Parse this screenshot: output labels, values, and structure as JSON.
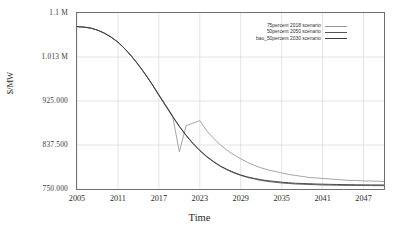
{
  "chart_data": {
    "type": "line",
    "title": "",
    "xlabel": "Time",
    "ylabel": "$/MW",
    "xlim": [
      2005,
      2050
    ],
    "ylim": [
      750000,
      1100000
    ],
    "grid": true,
    "legend_position": "top-right",
    "xticks": [
      "2005",
      "2011",
      "2017",
      "2023",
      "2029",
      "2035",
      "2041",
      "2047"
    ],
    "xtick_values": [
      2005,
      2011,
      2017,
      2023,
      2029,
      2035,
      2041,
      2047
    ],
    "yticks": [
      "750.000",
      "837.500",
      "925.000",
      "1.013 M",
      "1.1 M"
    ],
    "ytick_values": [
      750000,
      837500,
      925000,
      1012500,
      1100000
    ],
    "x": [
      2005,
      2006,
      2007,
      2008,
      2009,
      2010,
      2011,
      2012,
      2013,
      2014,
      2015,
      2016,
      2017,
      2018,
      2019,
      2020,
      2021,
      2022,
      2023,
      2024,
      2025,
      2026,
      2027,
      2028,
      2029,
      2030,
      2031,
      2032,
      2033,
      2034,
      2035,
      2036,
      2037,
      2038,
      2039,
      2040,
      2041,
      2042,
      2043,
      2044,
      2045,
      2046,
      2047,
      2048,
      2049,
      2050
    ],
    "series": [
      {
        "name": "75percent 2018 scenario",
        "color": "#9a9a9a",
        "values": [
          1073000,
          1072000,
          1070000,
          1066000,
          1060000,
          1052000,
          1042000,
          1029000,
          1014000,
          997000,
          979000,
          959000,
          938000,
          917000,
          896000,
          824000,
          876000,
          881000,
          886000,
          866000,
          851000,
          838000,
          827000,
          818000,
          810000,
          803000,
          797000,
          792000,
          788000,
          785000,
          782000,
          779000,
          777000,
          775000,
          773000,
          772000,
          771000,
          770000,
          769000,
          768000,
          767000,
          767000,
          766000,
          766000,
          765500,
          765000
        ]
      },
      {
        "name": "50percent 2050 scenario",
        "color": "#555555",
        "values": [
          1073000,
          1072000,
          1070000,
          1066000,
          1060000,
          1052000,
          1042000,
          1029000,
          1014000,
          997000,
          978000,
          958000,
          936000,
          915000,
          894000,
          874000,
          856000,
          840000,
          826000,
          814000,
          804000,
          795000,
          788000,
          782000,
          777000,
          773000,
          770000,
          767000,
          765000,
          763500,
          762000,
          761000,
          760000,
          759500,
          759000,
          758500,
          758000,
          757800,
          757500,
          757300,
          757100,
          757000,
          756900,
          756800,
          756700,
          756600
        ]
      },
      {
        "name": "bau_50percent 2030 scenario",
        "color": "#3c3c3c",
        "values": [
          1073000,
          1072000,
          1070000,
          1066000,
          1060000,
          1052000,
          1042000,
          1029000,
          1014000,
          997000,
          978500,
          958500,
          937000,
          916000,
          895000,
          875000,
          857000,
          841000,
          827000,
          815000,
          805000,
          796000,
          789000,
          783000,
          778000,
          774000,
          771000,
          768500,
          766500,
          765000,
          763500,
          762500,
          761500,
          761000,
          760500,
          760000,
          759600,
          759300,
          759000,
          758800,
          758600,
          758400,
          758300,
          758200,
          758100,
          758000
        ]
      }
    ]
  },
  "axis": {
    "y_title": "$/MW",
    "x_title": "Time"
  },
  "colors": {
    "frame": "#6f6f6f",
    "grid": "#d8d8d8",
    "background": "#ffffff",
    "text": "#2b2b2b"
  }
}
